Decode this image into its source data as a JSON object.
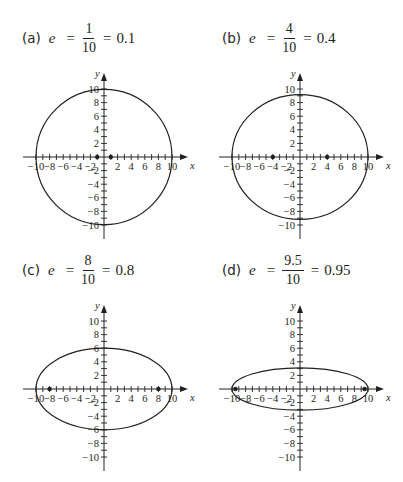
{
  "figure": {
    "panels": [
      {
        "label": "(a)",
        "variable": "e",
        "numerator": "1",
        "denominator": "10",
        "decimal": "0.1"
      },
      {
        "label": "(b)",
        "variable": "e",
        "numerator": "4",
        "denominator": "10",
        "decimal": "0.4"
      },
      {
        "label": "(c)",
        "variable": "e",
        "numerator": "8",
        "denominator": "10",
        "decimal": "0.8"
      },
      {
        "label": "(d)",
        "variable": "e",
        "numerator": "9.5",
        "denominator": "10",
        "decimal": "0.95"
      }
    ],
    "equals_sign": "="
  },
  "chart_data": [
    {
      "type": "line",
      "title": "(a) e = 1/10 = 0.1",
      "xlabel": "x",
      "ylabel": "y",
      "xlim": [
        -10,
        10
      ],
      "ylim": [
        -10,
        10
      ],
      "x_ticks": [
        -10,
        -8,
        -6,
        -4,
        -2,
        2,
        4,
        6,
        8,
        10
      ],
      "y_ticks": [
        -10,
        -8,
        -6,
        -4,
        -2,
        2,
        4,
        6,
        8,
        10
      ],
      "grid": false,
      "ellipse": {
        "center": [
          0,
          0
        ],
        "semi_major_a": 10,
        "semi_minor_b": 9.95,
        "eccentricity": 0.1
      },
      "foci": [
        [
          -1,
          0
        ],
        [
          1,
          0
        ]
      ]
    },
    {
      "type": "line",
      "title": "(b) e = 4/10 = 0.4",
      "xlabel": "x",
      "ylabel": "y",
      "xlim": [
        -10,
        10
      ],
      "ylim": [
        -10,
        10
      ],
      "x_ticks": [
        -10,
        -8,
        -6,
        -4,
        -2,
        2,
        4,
        6,
        8,
        10
      ],
      "y_ticks": [
        -10,
        -8,
        -6,
        -4,
        -2,
        2,
        4,
        6,
        8,
        10
      ],
      "grid": false,
      "ellipse": {
        "center": [
          0,
          0
        ],
        "semi_major_a": 10,
        "semi_minor_b": 9.17,
        "eccentricity": 0.4
      },
      "foci": [
        [
          -4,
          0
        ],
        [
          4,
          0
        ]
      ]
    },
    {
      "type": "line",
      "title": "(c) e = 8/10 = 0.8",
      "xlabel": "x",
      "ylabel": "y",
      "xlim": [
        -10,
        10
      ],
      "ylim": [
        -10,
        10
      ],
      "x_ticks": [
        -10,
        -8,
        -6,
        -4,
        -2,
        2,
        4,
        6,
        8,
        10
      ],
      "y_ticks": [
        -10,
        -8,
        -6,
        -4,
        -2,
        2,
        4,
        6,
        8,
        10
      ],
      "grid": false,
      "ellipse": {
        "center": [
          0,
          0
        ],
        "semi_major_a": 10,
        "semi_minor_b": 6,
        "eccentricity": 0.8
      },
      "foci": [
        [
          -8,
          0
        ],
        [
          8,
          0
        ]
      ]
    },
    {
      "type": "line",
      "title": "(d) e = 9.5/10 = 0.95",
      "xlabel": "x",
      "ylabel": "y",
      "xlim": [
        -10,
        10
      ],
      "ylim": [
        -10,
        10
      ],
      "x_ticks": [
        -10,
        -8,
        -6,
        -4,
        -2,
        2,
        4,
        6,
        8,
        10
      ],
      "y_ticks": [
        -10,
        -8,
        -6,
        -4,
        -2,
        2,
        4,
        6,
        8,
        10
      ],
      "grid": false,
      "ellipse": {
        "center": [
          0,
          0
        ],
        "semi_major_a": 10,
        "semi_minor_b": 3.12,
        "eccentricity": 0.95
      },
      "foci": [
        [
          -9.5,
          0
        ],
        [
          9.5,
          0
        ]
      ]
    }
  ],
  "style": {
    "ink": "#231f20"
  }
}
